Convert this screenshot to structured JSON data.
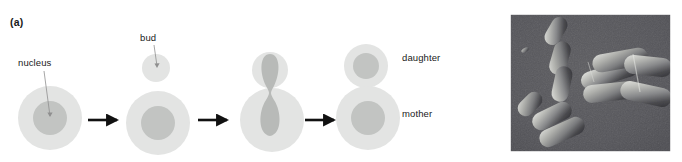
{
  "figure": {
    "panels": [
      {
        "letter": "(a)",
        "kind": "diagram"
      },
      {
        "letter": "(b)",
        "kind": "micrograph"
      }
    ]
  },
  "panel_a": {
    "letter": "(a)",
    "labels": {
      "nucleus": "nucleus",
      "bud": "bud",
      "daughter": "daughter",
      "mother": "mother"
    },
    "colors": {
      "cytoplasm": "#e3e4e3",
      "cytoplasm_edge": "#ededed",
      "nucleus": "#c2c4c2",
      "arrow": "#111111",
      "leader_line": "#8a8a8a",
      "text": "#1a1a1a"
    },
    "stages": [
      {
        "index": 1,
        "name": "unbudded-cell",
        "mother": {
          "cx": 50,
          "cy": 118,
          "r": 32
        },
        "nucleus": {
          "cx": 50,
          "cy": 118,
          "rx": 17,
          "ry": 17
        },
        "bud": null
      },
      {
        "index": 2,
        "name": "small-bud-emerging",
        "mother": {
          "cx": 158,
          "cy": 123,
          "r": 32
        },
        "nucleus": {
          "cx": 158,
          "cy": 123,
          "rx": 17,
          "ry": 17
        },
        "bud": {
          "cx": 156,
          "cy": 68,
          "r": 14
        }
      },
      {
        "index": 3,
        "name": "nucleus-dividing-through-neck",
        "mother": {
          "cx": 272,
          "cy": 120,
          "r": 32
        },
        "nucleus": {
          "shape": "dumbbell",
          "top_cy": 70,
          "bottom_cy": 114,
          "neck_cy": 92
        },
        "bud": {
          "cx": 270,
          "cy": 70,
          "r": 18
        }
      },
      {
        "index": 4,
        "name": "separated-mother-and-daughter",
        "mother": {
          "cx": 368,
          "cy": 118,
          "r": 32
        },
        "nucleus": {
          "cx": 368,
          "cy": 118,
          "rx": 17,
          "ry": 17
        },
        "daughter": {
          "cx": 366,
          "cy": 66,
          "r": 22
        },
        "daughter_nucleus": {
          "cx": 366,
          "cy": 66,
          "rx": 13,
          "ry": 13
        }
      }
    ],
    "arrows": [
      {
        "x1": 88,
        "x2": 121,
        "y": 120
      },
      {
        "x1": 198,
        "x2": 231,
        "y": 120
      },
      {
        "x1": 305,
        "x2": 338,
        "y": 120
      }
    ],
    "leaders": [
      {
        "name": "nucleus-leader",
        "x1": 44,
        "y1": 71,
        "x2": 50,
        "y2": 116
      },
      {
        "name": "bud-leader",
        "x1": 154,
        "y1": 45,
        "x2": 157,
        "y2": 68
      }
    ]
  },
  "panel_b": {
    "letter": "(b)",
    "frame": {
      "x": 510,
      "y": 14,
      "width": 161,
      "height": 138
    },
    "colors": {
      "background": "#56565a",
      "cell_light": "#cfd0cd",
      "cell_mid": "#8d8e8e",
      "cell_shadow": "#37373a",
      "border": "#ffffff"
    },
    "description": "differential interference contrast micrograph of elongated rod-shaped budding cells",
    "cells": [
      {
        "name": "cell-chain-upper",
        "cx": 556,
        "cy": 45,
        "angle": -58
      },
      {
        "name": "cell-chain-upper-2",
        "cx": 562,
        "cy": 75,
        "angle": -72
      },
      {
        "name": "cell-lower-left-small",
        "cx": 529,
        "cy": 110,
        "angle": -40
      },
      {
        "name": "cell-lower-left-mid",
        "cx": 550,
        "cy": 120,
        "angle": -28
      },
      {
        "name": "cell-lower-left-long",
        "cx": 560,
        "cy": 134,
        "angle": -26
      },
      {
        "name": "cell-cluster-upper",
        "cx": 612,
        "cy": 74,
        "angle": -16
      },
      {
        "name": "cell-cluster-mid",
        "cx": 608,
        "cy": 92,
        "angle": -20
      },
      {
        "name": "cell-cluster-right",
        "cx": 645,
        "cy": 80,
        "angle": 10
      },
      {
        "name": "cell-cluster-lower",
        "cx": 634,
        "cy": 104,
        "angle": 8
      }
    ]
  }
}
